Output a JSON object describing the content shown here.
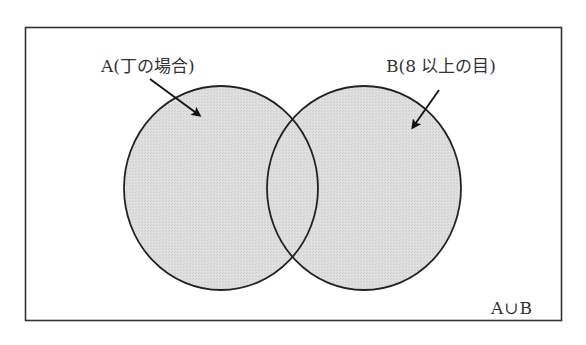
{
  "diagram": {
    "type": "venn",
    "universe_label": "A∪B",
    "sets": [
      {
        "id": "A",
        "label": "A(丁の場合)",
        "fill": "#dcdcdc",
        "stroke": "#222222"
      },
      {
        "id": "B",
        "label": "B(8 以上の目)",
        "fill": "#dcdcdc",
        "stroke": "#222222"
      }
    ],
    "frame_stroke": "#333333",
    "background": "#ffffff"
  }
}
